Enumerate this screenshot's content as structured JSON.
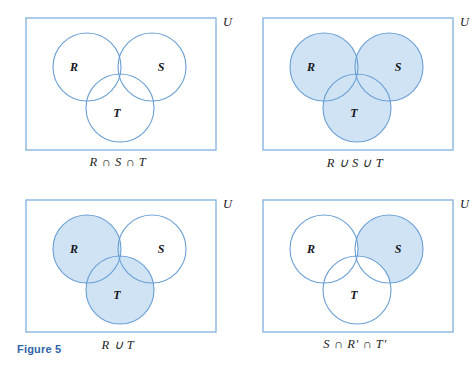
{
  "figure": {
    "label": "Figure 5",
    "label_color": "#2f63a8"
  },
  "style": {
    "stroke_color": "#6a9fd4",
    "rect_stroke_color": "#7fb0de",
    "fill_color": "#cfe3f4",
    "background": "#ffffff",
    "text_color": "#16161c"
  },
  "geometry": {
    "circle_radius": 34,
    "r_center": [
      87,
      67
    ],
    "s_center": [
      152,
      67
    ],
    "t_center": [
      120,
      108
    ],
    "rect": [
      26,
      18,
      190,
      132
    ]
  },
  "panels": [
    {
      "id": "panel-intersection",
      "caption": "R ∩ S ∩ T",
      "universe_label": "U",
      "sets": [
        "R",
        "S",
        "T"
      ],
      "shaded_regions": [
        "R∩S∩T"
      ],
      "shading_description": "only the central triple-overlap region is shaded"
    },
    {
      "id": "panel-union",
      "caption": "R ∪ S ∪ T",
      "universe_label": "U",
      "sets": [
        "R",
        "S",
        "T"
      ],
      "shaded_regions": [
        "R",
        "S",
        "T"
      ],
      "shading_description": "all three circles are fully shaded"
    },
    {
      "id": "panel-r-union-t",
      "caption": "R ∪ T",
      "universe_label": "U",
      "sets": [
        "R",
        "S",
        "T"
      ],
      "shaded_regions": [
        "R",
        "T"
      ],
      "shading_description": "circles R and T are fully shaded, S is unshaded"
    },
    {
      "id": "panel-s-only",
      "caption": "S ∩ R′ ∩ T′",
      "universe_label": "U",
      "sets": [
        "R",
        "S",
        "T"
      ],
      "shaded_regions": [
        "S minus R minus T"
      ],
      "shading_description": "only the part of S outside both R and T is shaded"
    }
  ]
}
